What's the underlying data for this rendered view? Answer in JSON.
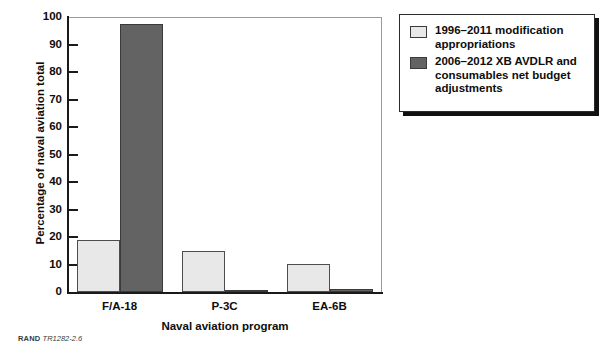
{
  "chart_data": {
    "type": "bar",
    "title": "",
    "xlabel": "Naval aviation program",
    "ylabel": "Percentage of naval aviation total",
    "categories": [
      "F/A-18",
      "P-3C",
      "EA-6B"
    ],
    "ylim": [
      0,
      100
    ],
    "yticks": [
      0,
      10,
      20,
      30,
      40,
      50,
      60,
      70,
      80,
      90,
      100
    ],
    "ytick_labels": [
      "0",
      "10",
      "20",
      "30",
      "40",
      "50",
      "60",
      "70",
      "80",
      "90",
      "100"
    ],
    "grid": false,
    "legend_position": "outside-top-right",
    "series": [
      {
        "name": "1996–2011 modification appropriations",
        "color": "#e8e8e8",
        "values": [
          19,
          14.8,
          10.2
        ]
      },
      {
        "name": "2006–2012 XB AVDLR and consumables net budget adjustments",
        "color": "#636363",
        "values": [
          97.3,
          0.3,
          1.1
        ]
      }
    ]
  },
  "axes": {
    "y_title": "Percentage of naval aviation total",
    "x_title": "Naval aviation program",
    "y_ticks": [
      "100",
      "90",
      "80",
      "70",
      "60",
      "50",
      "40",
      "30",
      "20",
      "10",
      "0"
    ],
    "x_categories": [
      "F/A-18",
      "P-3C",
      "EA-6B"
    ]
  },
  "legend": {
    "items": [
      {
        "swatch": "light",
        "label": "1996–2011 modification appropriations"
      },
      {
        "swatch": "dark",
        "label": "2006–2012 XB AVDLR and consumables net budget adjustments"
      }
    ]
  },
  "footer": {
    "source": "RAND",
    "code": "TR1282-2.6"
  },
  "colors": {
    "series_light": "#e8e8e8",
    "series_dark": "#636363",
    "axis": "#1a1a1a",
    "text": "#0d0d0d"
  }
}
